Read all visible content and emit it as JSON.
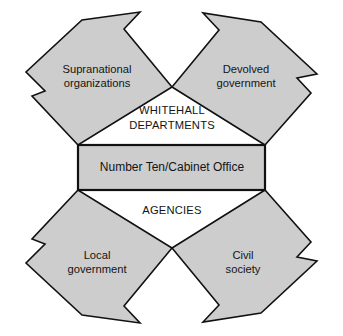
{
  "figure": {
    "background_color": "#ffffff",
    "shape_fill_color": "#cdcdcd",
    "shape_stroke_color": "#111111",
    "text_color": "#141414",
    "caption": ""
  },
  "center": {
    "label": "Number Ten/Cabinet Office"
  },
  "inner_labels": [
    {
      "id": "whitehall",
      "line1": "WHITEHALL",
      "line2": "DEPARTMENTS"
    },
    {
      "id": "agencies",
      "line1": "AGENCIES",
      "line2": ""
    }
  ],
  "nodes": [
    {
      "id": "supranational-organizations",
      "line1": "Supranational",
      "line2": "organizations",
      "position": "top-left"
    },
    {
      "id": "devolved-government",
      "line1": "Devolved",
      "line2": "government",
      "position": "top-right"
    },
    {
      "id": "local-government",
      "line1": "Local",
      "line2": "government",
      "position": "bottom-left"
    },
    {
      "id": "civil-society",
      "line1": "Civil",
      "line2": "society",
      "position": "bottom-right"
    }
  ],
  "geometry": {
    "polygons": {
      "supranational": "78,145 32,96 45,91 26,72 82,20 140,12 124,29 172,87",
      "devolved": "265,145 172,87 219,30 203,13 261,22 317,74 297,78 311,93",
      "local": "78,190 32,239 45,244 26,263 82,315 140,323 124,306 172,248",
      "civil": "265,190 172,248 219,305 203,322 261,313 317,261 297,257 311,242"
    },
    "center_box": {
      "x": 78,
      "y": 145,
      "width": 187,
      "height": 45
    },
    "label_points": {
      "supranational": {
        "x": 97,
        "y": 76
      },
      "devolved": {
        "x": 246,
        "y": 76
      },
      "local": {
        "x": 97,
        "y": 262
      },
      "civil": {
        "x": 243,
        "y": 262
      },
      "whitehall": {
        "x": 172,
        "y": 116
      },
      "agencies": {
        "x": 172,
        "y": 211
      },
      "center": {
        "x": 172,
        "y": 168
      }
    }
  }
}
